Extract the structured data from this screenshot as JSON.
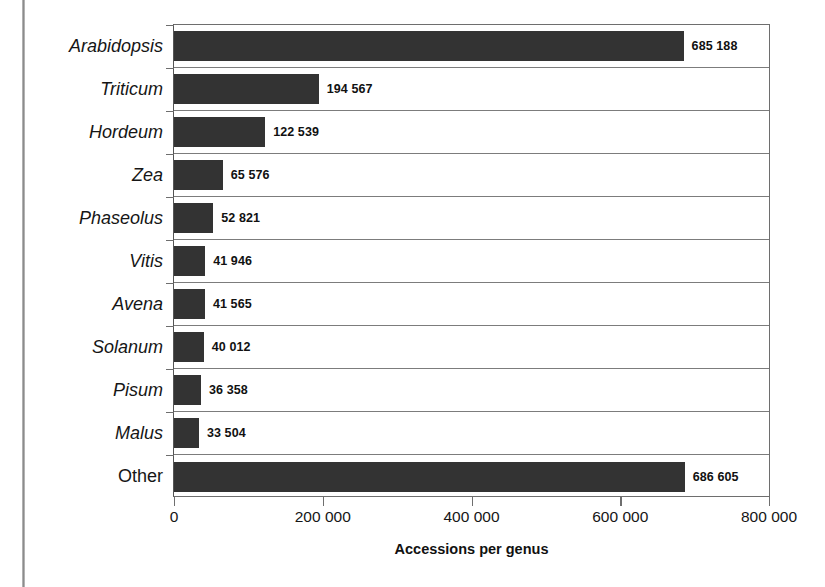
{
  "chart_data": {
    "type": "bar",
    "orientation": "horizontal",
    "title": "",
    "xlabel": "Accessions per genus",
    "ylabel": "",
    "xlim": [
      0,
      800000
    ],
    "grid": true,
    "legend": null,
    "categories": [
      "Arabidopsis",
      "Triticum",
      "Hordeum",
      "Zea",
      "Phaseolus",
      "Vitis",
      "Avena",
      "Solanum",
      "Pisum",
      "Malus",
      "Other"
    ],
    "values": [
      685188,
      194567,
      122539,
      65576,
      52821,
      41946,
      41565,
      40012,
      36358,
      33504,
      686605
    ],
    "value_labels": [
      "685 188",
      "194 567",
      "122 539",
      "65 576",
      "52 821",
      "41 946",
      "41 565",
      "40 012",
      "36 358",
      "33 504",
      "686 605"
    ],
    "category_styles": [
      "italic",
      "italic",
      "italic",
      "italic",
      "italic",
      "italic",
      "italic",
      "italic",
      "italic",
      "italic",
      "normal"
    ],
    "xticks": [
      0,
      200000,
      400000,
      600000,
      800000
    ],
    "xtick_labels": [
      "0",
      "200 000",
      "400 000",
      "600 000",
      "800 000"
    ],
    "bar_color": "#333333",
    "axis_color": "#6e6e6e",
    "background": "#ffffff"
  },
  "axis": {
    "x_title": "Accessions per genus"
  }
}
